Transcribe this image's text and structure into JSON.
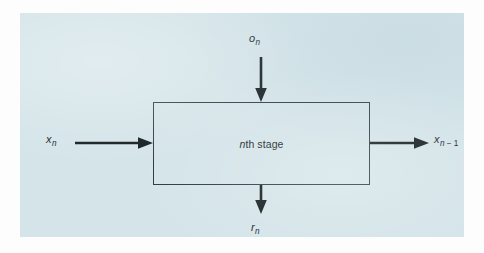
{
  "figure": {
    "type": "block-diagram",
    "panel": {
      "background_color": "#d4e4e9",
      "outer_background_color": "#fdfdfd"
    },
    "block": {
      "name": "nth-stage",
      "label_italic_part": "n",
      "label_rest": "th stage",
      "border_color": "#2c3a40"
    },
    "signals": {
      "input_top": {
        "symbol": "o",
        "subscript": "n",
        "direction": "down",
        "role": "input"
      },
      "input_left": {
        "symbol": "x",
        "subscript": "n",
        "direction": "right",
        "role": "input"
      },
      "output_right": {
        "symbol": "x",
        "subscript_var": "n",
        "subscript_op": " − 1",
        "direction": "right",
        "role": "output"
      },
      "output_bottom": {
        "symbol": "r",
        "subscript": "n",
        "direction": "down",
        "role": "output"
      }
    },
    "arrow_color": "#111a1e"
  }
}
